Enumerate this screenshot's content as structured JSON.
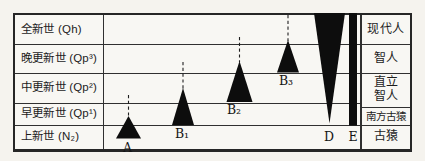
{
  "figure": {
    "colors": {
      "ink": "#262626",
      "grid_line": "#303030",
      "marker_fill": "#0d0d0d",
      "paper": "#f8f7f3"
    },
    "epoch_column": {
      "rows": [
        {
          "label": "全新世 (Qh)"
        },
        {
          "label": "晚更新世 (Qp³)"
        },
        {
          "label": "中更新世 (Qp²)"
        },
        {
          "label": "早更新世 (Qp¹)"
        },
        {
          "label": "上新世 (N₂)"
        }
      ]
    },
    "stage_column": {
      "rows": [
        {
          "label": "现代人"
        },
        {
          "label": "智人"
        },
        {
          "label": "直立\n智人"
        },
        {
          "label": "南方古猿"
        },
        {
          "label": "古猿"
        }
      ]
    },
    "markers": [
      {
        "id": "A",
        "label": "A",
        "type": "triangle-up",
        "cx": 128.5,
        "apex_y": 116,
        "base_y": 138.5,
        "half_width": 12.5,
        "dash_top_y": 95,
        "label_x": 127.5,
        "label_y": 147
      },
      {
        "id": "B1",
        "label": "B₁",
        "type": "triangle-up",
        "cx": 183,
        "apex_y": 88,
        "base_y": 125,
        "half_width": 11,
        "dash_top_y": 62,
        "label_x": 182,
        "label_y": 133
      },
      {
        "id": "B2",
        "label": "B₂",
        "type": "triangle-up",
        "cx": 239.5,
        "apex_y": 61,
        "base_y": 102,
        "half_width": 13,
        "dash_top_y": 37,
        "label_x": 234,
        "label_y": 109.5
      },
      {
        "id": "B3",
        "label": "B₃",
        "type": "triangle-up",
        "cx": 288,
        "apex_y": 40,
        "base_y": 72.5,
        "half_width": 11,
        "dash_top_y": 15,
        "label_x": 286,
        "label_y": 80
      },
      {
        "id": "D",
        "label": "D",
        "type": "triangle-down",
        "x_left": 314,
        "x_right": 345,
        "top_y": 13,
        "apex_y": 123.5,
        "label_x": 329,
        "label_y": 136
      },
      {
        "id": "E",
        "label": "E",
        "type": "bar",
        "x_left": 349,
        "x_right": 357,
        "top_y": 13,
        "bottom_y": 125.5,
        "label_x": 353,
        "label_y": 136
      }
    ]
  }
}
